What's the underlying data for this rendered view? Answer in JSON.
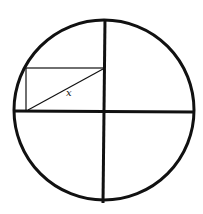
{
  "diagram": {
    "title": "",
    "colors": {
      "stroke": "#111111",
      "background": "#ffffff"
    },
    "circle": {
      "cx": 104,
      "cy": 110,
      "r": 90
    },
    "axes": {
      "horizontal": {
        "x1": 14,
        "y1": 111,
        "x2": 194,
        "y2": 112
      },
      "vertical": {
        "x1": 105,
        "y1": 19,
        "x2": 103,
        "y2": 203
      }
    },
    "rectangle": {
      "x": 26,
      "y": 68,
      "width": 78,
      "height": 43
    },
    "diagonal": {
      "x1": 28,
      "y1": 110,
      "x2": 103,
      "y2": 69
    },
    "labels": [
      {
        "text": "x",
        "x": 66,
        "y": 96
      }
    ]
  }
}
